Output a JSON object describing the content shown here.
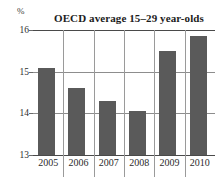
{
  "chart_data": {
    "type": "bar",
    "title": "OECD average 15–29 year-olds",
    "xlabel": "",
    "ylabel": "%",
    "unit_label": "%",
    "categories": [
      "2005",
      "2006",
      "2007",
      "2008",
      "2009",
      "2010"
    ],
    "values": [
      15.1,
      14.6,
      14.3,
      14.05,
      15.5,
      15.85
    ],
    "series": [
      {
        "name": "OECD average 15–29 year-olds",
        "values": [
          15.1,
          14.6,
          14.3,
          14.05,
          15.5,
          15.85
        ]
      }
    ],
    "ylim": [
      13,
      16
    ],
    "yticks": [
      "13",
      "14",
      "15",
      "16"
    ],
    "ytick_values": [
      13,
      14,
      15,
      16
    ],
    "grid": true,
    "grid_orientation": "both",
    "legend": false,
    "legend_position": "none",
    "bar_color": "#5a5a5a",
    "axis_color": "#4a4a4a",
    "gridline_color": "#9a9a9a",
    "background_color": "#ffffff",
    "text_color": "#2b2b2b"
  }
}
